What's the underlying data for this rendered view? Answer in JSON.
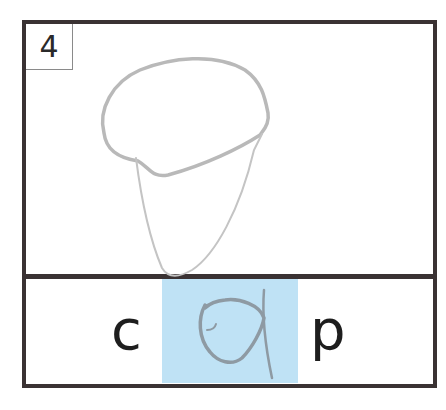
{
  "card": {
    "number": "4",
    "picture_description": "hand-drawn pencil sketch of a cap",
    "letters": {
      "first": "c",
      "middle_handwritten": "a",
      "last": "p"
    },
    "highlight_color": "#bfe2f5",
    "border_color": "#3a3233"
  }
}
